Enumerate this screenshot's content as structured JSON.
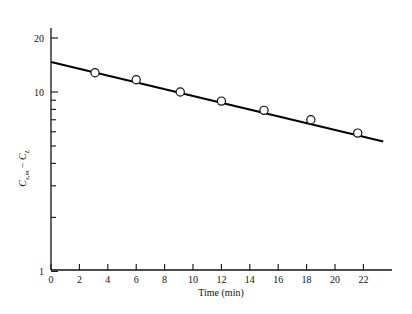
{
  "chart_data": {
    "type": "scatter",
    "title": "",
    "xlabel": "Time (min)",
    "ylabel": "Cs,m − CL",
    "ylabel_parts": {
      "sym1": "C",
      "sub1": "s,m",
      "minus": "−",
      "sym2": "C",
      "sub2": "L"
    },
    "xscale": "linear",
    "yscale": "log",
    "xlim": [
      0,
      23.4
    ],
    "ylim": [
      1,
      25
    ],
    "grid": false,
    "legend": null,
    "xticks": [
      0,
      2,
      4,
      6,
      8,
      10,
      12,
      14,
      16,
      18,
      20,
      22
    ],
    "xticklabels": [
      "0",
      "2",
      "4",
      "6",
      "8",
      "10",
      "12",
      "14",
      "16",
      "18",
      "20",
      "22"
    ],
    "yticks_labeled": [
      1,
      10,
      20
    ],
    "yticklabels": [
      "1",
      "10",
      "20"
    ],
    "yticks_minor": [
      2,
      3,
      4,
      5,
      6,
      7,
      8,
      9,
      20
    ],
    "x": [
      3.1,
      6.0,
      9.1,
      12.0,
      15.0,
      18.3,
      21.6
    ],
    "values": [
      12.8,
      11.7,
      10.0,
      8.9,
      7.9,
      7.0,
      5.9
    ],
    "marker": "open-circle",
    "fit_line": {
      "x": [
        0.0,
        23.4
      ],
      "y": [
        14.7,
        5.3
      ],
      "style": "solid",
      "color": "#000000"
    },
    "series": [
      {
        "name": "data",
        "points": [
          {
            "t": 3.1,
            "v": 12.8
          },
          {
            "t": 6.0,
            "v": 11.7
          },
          {
            "t": 9.1,
            "v": 10.0
          },
          {
            "t": 12.0,
            "v": 8.9
          },
          {
            "t": 15.0,
            "v": 7.9
          },
          {
            "t": 18.3,
            "v": 7.0
          },
          {
            "t": 21.6,
            "v": 5.9
          }
        ]
      }
    ],
    "colors": {
      "axis": "#111111",
      "line": "#000000",
      "marker_edge": "#111111",
      "marker_face": "#ffffff",
      "background": "#ffffff"
    }
  }
}
